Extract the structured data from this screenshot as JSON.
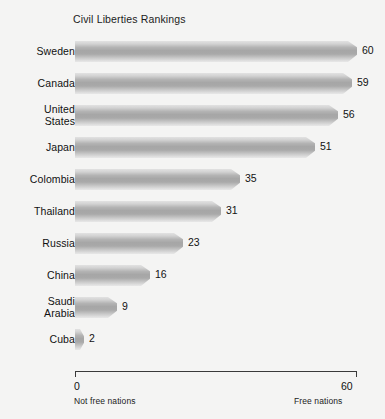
{
  "chart_data": {
    "type": "bar",
    "orientation": "horizontal",
    "title": "Civil Liberties Rankings",
    "xlabel": "",
    "ylabel": "",
    "xlim": [
      0,
      60
    ],
    "grid": false,
    "legend": null,
    "categories": [
      "Sweden",
      "Canada",
      "United States",
      "Japan",
      "Colombia",
      "Thailand",
      "Russia",
      "China",
      "Saudi Arabia",
      "Cuba"
    ],
    "values": [
      60,
      59,
      56,
      51,
      35,
      31,
      23,
      16,
      9,
      2
    ],
    "bars": [
      {
        "label_line1": "Sweden",
        "label_line2": "",
        "value": 60,
        "value_text": "60"
      },
      {
        "label_line1": "Canada",
        "label_line2": "",
        "value": 59,
        "value_text": "59"
      },
      {
        "label_line1": "United",
        "label_line2": "States",
        "value": 56,
        "value_text": "56"
      },
      {
        "label_line1": "Japan",
        "label_line2": "",
        "value": 51,
        "value_text": "51"
      },
      {
        "label_line1": "Colombia",
        "label_line2": "",
        "value": 35,
        "value_text": "35"
      },
      {
        "label_line1": "Thailand",
        "label_line2": "",
        "value": 31,
        "value_text": "31"
      },
      {
        "label_line1": "Russia",
        "label_line2": "",
        "value": 23,
        "value_text": "23"
      },
      {
        "label_line1": "China",
        "label_line2": "",
        "value": 16,
        "value_text": "16"
      },
      {
        "label_line1": "Saudi",
        "label_line2": "Arabia",
        "value": 9,
        "value_text": "9"
      },
      {
        "label_line1": "Cuba",
        "label_line2": "",
        "value": 2,
        "value_text": "2"
      }
    ],
    "axis": {
      "tick_labels": [
        "0",
        "60"
      ],
      "left_note": "Not free nations",
      "right_note": "Free nations"
    },
    "colors": {
      "background": "#f4f4f3",
      "bar_light": "#e2e2e2",
      "bar_mid": "#a6a6a6",
      "bar_dark": "#9c9c9c",
      "text": "#111111",
      "axis": "#3a3a3a"
    }
  }
}
